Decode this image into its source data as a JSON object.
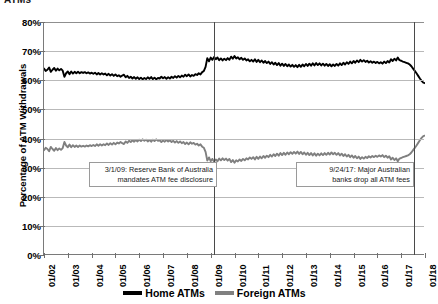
{
  "chart_data": {
    "type": "line",
    "title": "ATMs",
    "xlabel": "",
    "ylabel": "Percentage of ATM Withdrawals",
    "ylim": [
      0,
      80
    ],
    "ytick_labels": [
      "80%",
      "70%",
      "60%",
      "50%",
      "40%",
      "30%",
      "20%",
      "10%",
      "0%"
    ],
    "ytick_values": [
      80,
      70,
      60,
      50,
      40,
      30,
      20,
      10,
      0
    ],
    "grid": "horizontal",
    "legend_position": "bottom",
    "x_tick_labels": [
      "01/02",
      "01/03",
      "01/04",
      "01/05",
      "01/06",
      "01/07",
      "01/08",
      "01/09",
      "01/10",
      "01/11",
      "01/12",
      "01/13",
      "01/14",
      "01/15",
      "01/16",
      "01/17",
      "01/18"
    ],
    "x_start": "01/02",
    "x_end": "01/18",
    "series": [
      {
        "name": "Home ATMs",
        "color": "#000000",
        "values": [
          64.0,
          63.2,
          63.6,
          64.4,
          62.9,
          63.6,
          64.2,
          63.3,
          64.0,
          63.4,
          63.9,
          63.3,
          61.2,
          62.4,
          63.0,
          62.1,
          63.0,
          62.3,
          62.9,
          62.4,
          62.9,
          62.4,
          62.8,
          62.5,
          62.8,
          62.4,
          62.7,
          62.3,
          62.6,
          62.2,
          62.6,
          62.0,
          62.5,
          62.0,
          62.4,
          62.0,
          62.3,
          61.7,
          62.2,
          61.6,
          62.1,
          61.5,
          62.0,
          61.4,
          61.7,
          61.2,
          61.6,
          61.9,
          61.0,
          61.5,
          60.8,
          61.2,
          60.6,
          61.1,
          60.5,
          61.0,
          60.4,
          60.9,
          60.3,
          60.8,
          60.4,
          61.0,
          60.5,
          61.1,
          60.4,
          60.9,
          60.3,
          60.8,
          60.6,
          61.2,
          60.7,
          61.1,
          60.5,
          61.0,
          60.6,
          61.2,
          60.8,
          61.4,
          60.9,
          61.5,
          61.0,
          61.6,
          61.2,
          61.9,
          61.4,
          62.0,
          61.3,
          61.8,
          61.5,
          62.1,
          61.8,
          62.4,
          62.0,
          62.8,
          63.2,
          64.6,
          67.6,
          66.5,
          67.8,
          67.0,
          68.0,
          67.2,
          67.8,
          66.9,
          67.5,
          66.8,
          67.4,
          66.9,
          67.6,
          67.0,
          68.1,
          67.4,
          68.3,
          67.5,
          67.9,
          67.2,
          67.7,
          67.0,
          67.5,
          66.8,
          67.2,
          66.5,
          67.0,
          66.4,
          67.2,
          66.3,
          67.0,
          66.2,
          66.8,
          66.0,
          66.6,
          65.9,
          66.4,
          65.6,
          66.2,
          65.4,
          66.0,
          65.2,
          65.9,
          65.0,
          65.7,
          64.9,
          65.6,
          64.8,
          65.4,
          64.7,
          65.3,
          64.6,
          65.2,
          64.5,
          65.3,
          64.6,
          65.4,
          64.8,
          65.6,
          64.9,
          65.7,
          65.0,
          65.8,
          65.1,
          65.9,
          65.2,
          65.8,
          65.1,
          65.7,
          65.0,
          65.6,
          64.9,
          65.5,
          64.8,
          65.4,
          64.9,
          65.6,
          65.0,
          65.8,
          65.2,
          66.0,
          65.4,
          66.2,
          65.6,
          66.4,
          65.8,
          66.6,
          66.0,
          66.8,
          66.2,
          67.0,
          66.4,
          66.9,
          66.3,
          66.7,
          66.1,
          66.5,
          66.0,
          66.4,
          65.9,
          66.3,
          65.8,
          66.2,
          65.7,
          66.4,
          65.9,
          66.6,
          66.1,
          67.2,
          66.6,
          67.4,
          66.8,
          67.8,
          66.9,
          66.7,
          66.4,
          66.2,
          66.0,
          65.8,
          65.4,
          64.8,
          64.0,
          63.2,
          62.4,
          61.5,
          60.6,
          59.8,
          59.2,
          59.0
        ],
        "start_value": 64.0,
        "end_value": 59.0,
        "min_value": 59.0,
        "max_value": 68.3
      },
      {
        "name": "Foreign ATMs",
        "color": "#808080",
        "values": [
          36.0,
          36.8,
          36.4,
          35.6,
          37.1,
          36.4,
          35.8,
          36.7,
          36.0,
          36.6,
          36.1,
          36.7,
          38.8,
          37.6,
          37.0,
          37.9,
          37.0,
          37.7,
          37.1,
          37.6,
          37.1,
          37.6,
          37.2,
          37.5,
          37.2,
          37.6,
          37.3,
          37.7,
          37.4,
          37.8,
          37.4,
          38.0,
          37.5,
          38.0,
          37.6,
          38.0,
          37.7,
          38.3,
          37.8,
          38.4,
          37.9,
          38.5,
          38.0,
          38.6,
          38.3,
          38.8,
          38.4,
          38.1,
          39.0,
          38.5,
          39.2,
          38.8,
          39.4,
          38.9,
          39.5,
          39.0,
          39.6,
          39.1,
          39.7,
          39.2,
          39.6,
          39.0,
          39.5,
          38.9,
          39.6,
          39.1,
          39.7,
          39.2,
          39.4,
          38.8,
          39.3,
          38.9,
          39.5,
          39.0,
          39.4,
          38.8,
          39.2,
          38.6,
          39.1,
          38.5,
          39.0,
          38.4,
          38.8,
          38.1,
          38.6,
          38.0,
          38.7,
          38.2,
          38.5,
          37.9,
          38.2,
          37.6,
          38.0,
          37.2,
          36.8,
          35.4,
          32.4,
          33.5,
          32.2,
          33.0,
          32.0,
          32.8,
          32.2,
          33.1,
          32.5,
          33.2,
          32.6,
          33.1,
          32.4,
          33.0,
          31.9,
          32.6,
          31.7,
          32.5,
          32.1,
          32.8,
          32.3,
          33.0,
          32.5,
          33.2,
          32.8,
          33.5,
          33.0,
          33.6,
          32.8,
          33.7,
          33.0,
          33.8,
          33.2,
          34.0,
          33.4,
          34.1,
          33.6,
          34.4,
          33.8,
          34.6,
          34.0,
          34.8,
          34.1,
          35.0,
          34.3,
          35.1,
          34.4,
          35.2,
          34.6,
          35.3,
          34.7,
          35.4,
          34.8,
          35.5,
          34.7,
          35.4,
          34.6,
          35.2,
          34.4,
          35.1,
          34.3,
          35.0,
          34.2,
          34.9,
          34.1,
          34.8,
          34.2,
          34.9,
          34.3,
          35.0,
          34.4,
          35.1,
          34.5,
          35.2,
          34.6,
          35.1,
          34.4,
          35.0,
          34.2,
          34.8,
          34.0,
          34.6,
          33.8,
          34.4,
          33.6,
          34.2,
          33.4,
          34.0,
          33.2,
          33.8,
          33.0,
          33.6,
          33.1,
          33.7,
          33.3,
          33.9,
          33.5,
          34.0,
          33.6,
          34.1,
          33.7,
          34.2,
          33.8,
          34.3,
          33.6,
          34.1,
          33.4,
          33.9,
          32.8,
          33.4,
          32.6,
          33.2,
          32.2,
          33.1,
          33.3,
          33.6,
          33.8,
          34.0,
          34.2,
          34.6,
          35.2,
          36.0,
          36.8,
          37.6,
          38.5,
          39.4,
          40.2,
          40.8,
          41.0
        ],
        "start_value": 36.0,
        "end_value": 41.0,
        "min_value": 31.7,
        "max_value": 41.0
      }
    ],
    "event_lines": [
      {
        "name": "rba-disclosure",
        "x_label": "01/09",
        "x_fraction": 0.4468,
        "note": "3/1/09: Reserve Bank of Australia mandates ATM fee disclosure"
      },
      {
        "name": "banks-drop-fees",
        "x_label": "01/18",
        "x_fraction": 0.9711,
        "note": "9/24/17: Major Australian banks drop all ATM fees"
      }
    ],
    "annotations": [
      {
        "id": "note-rba",
        "line1": "3/1/09: Reserve Bank of Australia",
        "line2": "mandates ATM fee disclosure"
      },
      {
        "id": "note-banks",
        "line1": "9/24/17: Major Australian",
        "line2": "banks drop all ATM fees"
      }
    ],
    "legend": [
      {
        "label": "Home ATMs",
        "color": "#000000"
      },
      {
        "label": "Foreign ATMs",
        "color": "#808080"
      }
    ]
  }
}
